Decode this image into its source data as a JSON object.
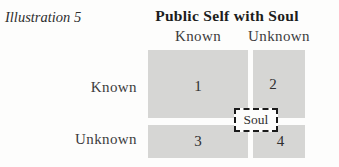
{
  "figure": {
    "illustration_label": "Illustration 5",
    "title": "Public Self with Soul"
  },
  "matrix": {
    "column_headers": [
      "Known",
      "Unknown"
    ],
    "row_headers": [
      "Known",
      "Unknown"
    ],
    "quadrants": [
      {
        "number": "1"
      },
      {
        "number": "2"
      },
      {
        "number": "3"
      },
      {
        "number": "4"
      }
    ],
    "overlay_label": "Soul"
  },
  "colors": {
    "quadrant_fill": "#d6d6d4",
    "background": "#fdfdfc",
    "title_text": "#1d1d1d",
    "label_text": "#3c3c3c",
    "overlay_border": "#1a1a1a"
  }
}
